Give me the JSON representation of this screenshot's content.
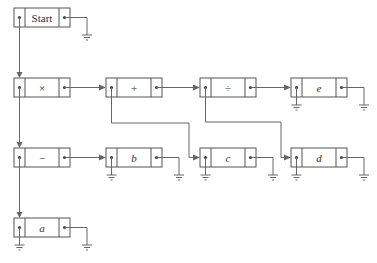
{
  "diagram": {
    "type": "linked-list expression tree",
    "nodes": [
      {
        "id": "start",
        "label": "Start",
        "italic": false,
        "x": 14,
        "y": 8
      },
      {
        "id": "times",
        "label": "×",
        "italic": false,
        "x": 14,
        "y": 78
      },
      {
        "id": "plus",
        "label": "+",
        "italic": false,
        "x": 106,
        "y": 78
      },
      {
        "id": "divide",
        "label": "÷",
        "italic": false,
        "x": 200,
        "y": 78
      },
      {
        "id": "e",
        "label": "e",
        "italic": true,
        "x": 291,
        "y": 78
      },
      {
        "id": "minus",
        "label": "−",
        "italic": false,
        "x": 14,
        "y": 148
      },
      {
        "id": "b",
        "label": "b",
        "italic": true,
        "x": 106,
        "y": 148
      },
      {
        "id": "c",
        "label": "c",
        "italic": true,
        "x": 200,
        "y": 148
      },
      {
        "id": "d",
        "label": "d",
        "italic": true,
        "x": 291,
        "y": 148
      },
      {
        "id": "a",
        "label": "a",
        "italic": true,
        "x": 14,
        "y": 218
      }
    ],
    "edges": [
      {
        "from": "start.left",
        "to": "times"
      },
      {
        "from": "times.right",
        "to": "plus"
      },
      {
        "from": "plus.right",
        "to": "divide"
      },
      {
        "from": "divide.right",
        "to": "e"
      },
      {
        "from": "times.left",
        "to": "minus"
      },
      {
        "from": "minus.right",
        "to": "b"
      },
      {
        "from": "plus.left",
        "to": "c"
      },
      {
        "from": "divide.left",
        "to": "d"
      },
      {
        "from": "minus.left",
        "to": "a"
      }
    ],
    "grounded_pointers": [
      "start.right",
      "e.left",
      "e.right",
      "b.left",
      "b.right",
      "c.left",
      "c.right",
      "d.left",
      "d.right",
      "a.left",
      "a.right"
    ],
    "colors": {
      "stroke": "#555555",
      "wire": "#666666",
      "background": "#ffffff"
    }
  }
}
